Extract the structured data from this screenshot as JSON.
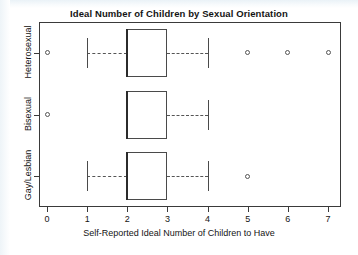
{
  "chart_data": {
    "type": "box",
    "title": "Ideal Number of Children by Sexual Orientation",
    "xlabel": "Self-Reported Ideal Number of Children to Have",
    "ylabel": "",
    "orientation": "horizontal",
    "xlim": [
      -0.35,
      7.35
    ],
    "grid": false,
    "legend": null,
    "xticks": [
      0,
      1,
      2,
      3,
      4,
      5,
      6,
      7
    ],
    "xtick_labels": [
      "0",
      "1",
      "2",
      "3",
      "4",
      "5",
      "6",
      "7"
    ],
    "categories": [
      "Heterosexual",
      "Bisexual",
      "Gay/Lesbian"
    ],
    "category_order_top_to_bottom": [
      "Heterosexual",
      "Bisexual",
      "Gay/Lesbian"
    ],
    "boxes": [
      {
        "category": "Heterosexual",
        "whisker_low": 1,
        "q1": 2,
        "median": 2,
        "q3": 3,
        "whisker_high": 4,
        "outliers": [
          0,
          5,
          6,
          7
        ]
      },
      {
        "category": "Bisexual",
        "whisker_low": 2,
        "q1": 2,
        "median": 2,
        "q3": 3,
        "whisker_high": 4,
        "outliers": [
          0
        ]
      },
      {
        "category": "Gay/Lesbian",
        "whisker_low": 1,
        "q1": 2,
        "median": 2,
        "q3": 3,
        "whisker_high": 4,
        "outliers": [
          5
        ]
      }
    ],
    "colors": {
      "box_edge": "#4a4a4a",
      "median": "#2b2b2b",
      "whisker": "#555555",
      "outlier": "#555555",
      "frame": "#3a3a3a",
      "text": "#141414",
      "background": "#ffffff"
    }
  }
}
